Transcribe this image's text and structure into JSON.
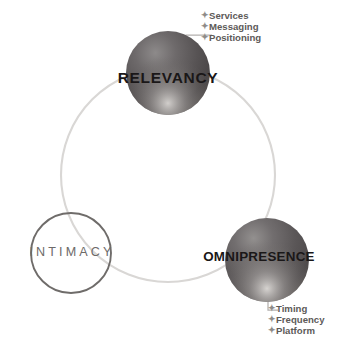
{
  "diagram": {
    "ring": {
      "stroke_color": "#d8d6d4",
      "center_x": 168,
      "center_y": 175,
      "radius": 107
    },
    "nodes": [
      {
        "id": "relevancy",
        "label": "RELEVANCY",
        "style": "filled-sphere",
        "fill_color": "#575354",
        "highlight_color": "#c9c6c4",
        "center_x": 168,
        "center_y": 73,
        "radius": 42
      },
      {
        "id": "intimacy",
        "label": "INTIMACY",
        "style": "outlined-circle",
        "stroke_color": "#6f6c6a",
        "text_color": "#6d6a68",
        "center_x": 71,
        "center_y": 253,
        "radius": 40
      },
      {
        "id": "omnipresence",
        "label": "OMNIPRESENCE",
        "style": "filled-sphere",
        "fill_color": "#5b5758",
        "highlight_color": "#cecbc9",
        "center_x": 267,
        "center_y": 260,
        "radius": 42
      }
    ],
    "callouts": [
      {
        "id": "relevancy-items",
        "attached_to": "relevancy",
        "bullet_glyph": "✦",
        "items": [
          "Services",
          "Messaging",
          "Positioning"
        ]
      },
      {
        "id": "omnipresence-items",
        "attached_to": "omnipresence",
        "bullet_glyph": "✦",
        "items": [
          "Timing",
          "Frequency",
          "Platform"
        ]
      }
    ],
    "leader_lines": [
      {
        "id": "relevancy-leader",
        "from_x": 170,
        "from_y": 51,
        "to_x": 200,
        "to_y": 26
      },
      {
        "id": "omnipresence-leader",
        "from_x": 268,
        "from_y": 282,
        "to_x": 266,
        "to_y": 313
      }
    ],
    "watermarks": [
      "",
      "",
      ""
    ]
  }
}
